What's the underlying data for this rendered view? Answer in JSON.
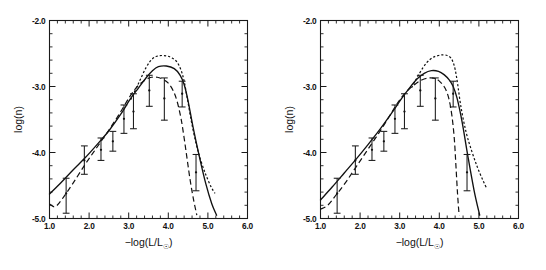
{
  "figure": {
    "title": "",
    "background_color": "#ffffff",
    "ink_color": "#111111",
    "panel_count": 2
  },
  "axes": {
    "xlabel_prefix": "−log(L/L",
    "xlabel_sub": "☉",
    "xlabel_suffix": ")",
    "xlabel_full": "−log(L/L☉)",
    "ylabel": "log(n)",
    "xlim": [
      1.0,
      6.0
    ],
    "ylim": [
      -5.0,
      -2.0
    ],
    "xticks_major": [
      "1.0",
      "2.0",
      "3.0",
      "4.0",
      "5.0",
      "6.0"
    ],
    "xticks_major_values": [
      1.0,
      2.0,
      3.0,
      4.0,
      5.0,
      6.0
    ],
    "xticks_minor_values": [
      1.2,
      1.4,
      1.6,
      1.8,
      2.2,
      2.4,
      2.6,
      2.8,
      3.2,
      3.4,
      3.6,
      3.8,
      4.2,
      4.4,
      4.6,
      4.8,
      5.2,
      5.4,
      5.6,
      5.8
    ],
    "yticks_major": [
      "-2.0",
      "-3.0",
      "-4.0",
      "-5.0"
    ],
    "yticks_major_values": [
      -2.0,
      -3.0,
      -4.0,
      -5.0
    ],
    "yticks_minor_values": [
      -2.2,
      -2.4,
      -2.6,
      -2.8,
      -3.2,
      -3.4,
      -3.6,
      -3.8,
      -4.2,
      -4.4,
      -4.6,
      -4.8
    ],
    "grid": false,
    "legend": "none"
  },
  "chart_data": [
    {
      "id": "left-panel",
      "type": "line",
      "title": "",
      "xlabel": "−log(L/L☉)",
      "ylabel": "log(n)",
      "xlim": [
        1.0,
        6.0
      ],
      "ylim": [
        -5.0,
        -2.0
      ],
      "grid": false,
      "legend": "none",
      "observed": {
        "name": "Observed luminosity function",
        "marker": "point-with-errorbars",
        "x": [
          1.42,
          1.88,
          2.3,
          2.6,
          2.88,
          3.12,
          3.52,
          3.9,
          4.35,
          4.7
        ],
        "y": [
          -4.62,
          -4.12,
          -3.96,
          -3.83,
          -3.49,
          -3.38,
          -3.06,
          -3.18,
          -3.11,
          -4.3
        ],
        "yerr_lo": [
          0.3,
          0.21,
          0.16,
          0.15,
          0.22,
          0.26,
          0.24,
          0.33,
          0.2,
          0.28
        ],
        "yerr_hi": [
          0.23,
          0.22,
          0.18,
          0.15,
          0.21,
          0.27,
          0.23,
          0.31,
          0.19,
          0.27
        ]
      },
      "series": [
        {
          "name": "model-solid",
          "style": "solid",
          "x": [
            1.0,
            1.3,
            1.6,
            1.9,
            2.2,
            2.5,
            2.8,
            3.05,
            3.25,
            3.45,
            3.6,
            3.75,
            3.95,
            4.15,
            4.3,
            4.4,
            4.5,
            4.62,
            4.78,
            4.95,
            5.1,
            5.22
          ],
          "y": [
            -4.63,
            -4.45,
            -4.26,
            -4.08,
            -3.88,
            -3.67,
            -3.42,
            -3.18,
            -3.02,
            -2.86,
            -2.76,
            -2.7,
            -2.69,
            -2.73,
            -2.83,
            -2.97,
            -3.22,
            -3.6,
            -4.05,
            -4.48,
            -4.78,
            -4.95
          ]
        },
        {
          "name": "model-dashed",
          "style": "dashed",
          "x": [
            1.0,
            1.15,
            1.35,
            1.6,
            1.9,
            2.2,
            2.5,
            2.78,
            3.02,
            3.22,
            3.42,
            3.58,
            3.72,
            3.86,
            4.0,
            4.12,
            4.22,
            4.32,
            4.4,
            4.48,
            4.56,
            4.64,
            4.72
          ],
          "y": [
            -4.78,
            -4.82,
            -4.68,
            -4.46,
            -4.18,
            -3.92,
            -3.66,
            -3.4,
            -3.16,
            -3.0,
            -2.9,
            -2.86,
            -2.86,
            -2.89,
            -2.95,
            -3.06,
            -3.22,
            -3.48,
            -3.78,
            -4.12,
            -4.45,
            -4.72,
            -4.95
          ]
        },
        {
          "name": "model-dotted",
          "style": "dotted",
          "x": [
            3.05,
            3.25,
            3.45,
            3.6,
            3.72,
            3.85,
            3.98,
            4.1,
            4.22,
            4.32,
            4.4,
            4.48,
            4.58,
            4.7,
            4.82,
            4.95,
            5.08,
            5.18
          ],
          "y": [
            -3.2,
            -2.95,
            -2.7,
            -2.58,
            -2.54,
            -2.53,
            -2.54,
            -2.57,
            -2.63,
            -2.75,
            -2.92,
            -3.18,
            -3.52,
            -3.86,
            -4.12,
            -4.34,
            -4.52,
            -4.62
          ]
        }
      ]
    },
    {
      "id": "right-panel",
      "type": "line",
      "title": "",
      "xlabel": "−log(L/L☉)",
      "ylabel": "log(n)",
      "xlim": [
        1.0,
        6.0
      ],
      "ylim": [
        -5.0,
        -2.0
      ],
      "grid": false,
      "legend": "none",
      "observed": {
        "name": "Observed luminosity function",
        "marker": "point-with-errorbars",
        "x": [
          1.42,
          1.88,
          2.3,
          2.6,
          2.88,
          3.12,
          3.52,
          3.9,
          4.35,
          4.7
        ],
        "y": [
          -4.62,
          -4.12,
          -3.96,
          -3.83,
          -3.49,
          -3.38,
          -3.06,
          -3.18,
          -3.11,
          -4.3
        ],
        "yerr_lo": [
          0.3,
          0.21,
          0.16,
          0.15,
          0.22,
          0.26,
          0.24,
          0.33,
          0.2,
          0.28
        ],
        "yerr_hi": [
          0.23,
          0.22,
          0.18,
          0.15,
          0.21,
          0.27,
          0.23,
          0.31,
          0.19,
          0.27
        ]
      },
      "series": [
        {
          "name": "model-solid",
          "style": "solid",
          "x": [
            1.0,
            1.3,
            1.6,
            1.9,
            2.2,
            2.5,
            2.8,
            3.05,
            3.25,
            3.45,
            3.62,
            3.8,
            3.98,
            4.12,
            4.25,
            4.35,
            4.45,
            4.58,
            4.72,
            4.88,
            5.02
          ],
          "y": [
            -4.72,
            -4.52,
            -4.31,
            -4.1,
            -3.88,
            -3.65,
            -3.4,
            -3.18,
            -3.02,
            -2.88,
            -2.8,
            -2.76,
            -2.77,
            -2.82,
            -2.9,
            -3.0,
            -3.18,
            -3.55,
            -4.05,
            -4.58,
            -4.95
          ]
        },
        {
          "name": "model-dashed",
          "style": "dashed",
          "x": [
            1.0,
            1.18,
            1.4,
            1.65,
            1.92,
            2.2,
            2.48,
            2.74,
            2.98,
            3.2,
            3.42,
            3.6,
            3.76,
            3.9,
            4.02,
            4.14,
            4.24,
            4.32,
            4.38,
            4.42,
            4.46,
            4.5
          ],
          "y": [
            -4.86,
            -4.8,
            -4.64,
            -4.44,
            -4.2,
            -3.95,
            -3.7,
            -3.45,
            -3.22,
            -3.06,
            -2.95,
            -2.89,
            -2.87,
            -2.88,
            -2.93,
            -3.02,
            -3.18,
            -3.45,
            -3.8,
            -4.2,
            -4.62,
            -4.95
          ]
        },
        {
          "name": "model-dotted",
          "style": "dotted",
          "x": [
            3.3,
            3.5,
            3.68,
            3.84,
            3.98,
            4.1,
            4.2,
            4.28,
            4.34,
            4.4,
            4.46,
            4.55,
            4.68,
            4.82,
            4.96,
            5.1,
            5.2
          ],
          "y": [
            -3.02,
            -2.8,
            -2.64,
            -2.56,
            -2.53,
            -2.52,
            -2.53,
            -2.56,
            -2.62,
            -2.74,
            -2.95,
            -3.32,
            -3.7,
            -3.98,
            -4.22,
            -4.42,
            -4.55
          ]
        }
      ]
    }
  ]
}
